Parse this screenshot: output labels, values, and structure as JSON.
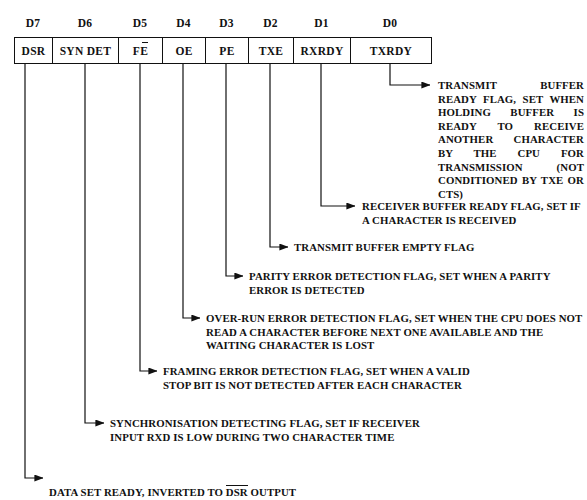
{
  "diagram": {
    "ink_color": "#111111",
    "background_color": "#ffffff"
  },
  "bit_labels": [
    {
      "id": "d7",
      "label": "D7"
    },
    {
      "id": "d6",
      "label": "D6"
    },
    {
      "id": "d5",
      "label": "D5"
    },
    {
      "id": "d4",
      "label": "D4"
    },
    {
      "id": "d3",
      "label": "D3"
    },
    {
      "id": "d2",
      "label": "D2"
    },
    {
      "id": "d1",
      "label": "D1"
    },
    {
      "id": "d0",
      "label": "D0"
    }
  ],
  "register_cells": [
    {
      "id": "dsr",
      "label": "DSR",
      "bit": "D7"
    },
    {
      "id": "syndet",
      "label": "SYN DET",
      "bit": "D6"
    },
    {
      "id": "fe",
      "label": "FE",
      "bit": "D5",
      "has_overline_mark": true
    },
    {
      "id": "oe",
      "label": "OE",
      "bit": "D4"
    },
    {
      "id": "pe",
      "label": "PE",
      "bit": "D3"
    },
    {
      "id": "txe",
      "label": "TXE",
      "bit": "D2"
    },
    {
      "id": "rxrdy",
      "label": "RXRDY",
      "bit": "D1"
    },
    {
      "id": "txrdy",
      "label": "TXRDY",
      "bit": "D0"
    }
  ],
  "annotations": {
    "txrdy": {
      "bit": "D0",
      "text": "TRANSMIT BUFFER READY FLAG, SET WHEN HOLDING BUFFER IS READY TO RECEIVE ANOTHER CHARACTER BY THE CPU FOR TRANSMISSION (NOT CONDITIONED BY TXE OR CTS)"
    },
    "rxrdy": {
      "bit": "D1",
      "text": "RECEIVER BUFFER READY FLAG, SET IF A CHARACTER IS RECEIVED"
    },
    "txe": {
      "bit": "D2",
      "text": "TRANSMIT BUFFER EMPTY FLAG"
    },
    "pe": {
      "bit": "D3",
      "text": "PARITY ERROR DETECTION FLAG, SET WHEN A PARITY ERROR IS DETECTED"
    },
    "oe": {
      "bit": "D4",
      "text": "OVER-RUN ERROR DETECTION FLAG, SET WHEN THE CPU DOES NOT READ A CHARACTER BEFORE NEXT ONE AVAILABLE AND THE WAITING CHARACTER IS LOST"
    },
    "fe": {
      "bit": "D5",
      "text": "FRAMING ERROR DETECTION FLAG, SET WHEN A VALID STOP BIT IS NOT DETECTED AFTER EACH CHARACTER"
    },
    "syndet": {
      "bit": "D6",
      "text": "SYNCHRONISATION DETECTING FLAG, SET IF RECEIVER INPUT RXD IS LOW DURING TWO CHARACTER TIME"
    },
    "dsr": {
      "bit": "D7",
      "text_before": "DATA SET READY, INVERTED TO ",
      "overlined_term": "DSR",
      "text_after": " OUTPUT"
    }
  }
}
